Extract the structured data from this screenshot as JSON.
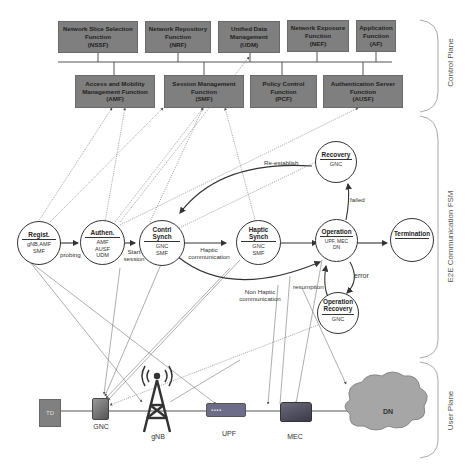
{
  "control_plane": {
    "label": "Control Plane",
    "top_functions": [
      {
        "name": "Network Slice Selection Function",
        "abbr": "(NSSF)"
      },
      {
        "name": "Network Repository Function",
        "abbr": "(NRF)"
      },
      {
        "name": "Unified Data Management",
        "abbr": "(UDM)"
      },
      {
        "name": "Network Exposure Function",
        "abbr": "(NEF)"
      },
      {
        "name": "Application Function",
        "abbr": "(AF)"
      }
    ],
    "bottom_functions": [
      {
        "name": "Access and Mobility Management Function",
        "abbr": "(AMF)"
      },
      {
        "name": "Session Management Function",
        "abbr": "(SMF)"
      },
      {
        "name": "Policy Control Function",
        "abbr": "(PCF)"
      },
      {
        "name": "Authentication Server Function",
        "abbr": "(AUSF)"
      }
    ]
  },
  "fsm": {
    "label": "E2E Communication FSM",
    "states": {
      "regist": {
        "title": "Regist.",
        "sub": "gNB,AMF SMF"
      },
      "authen": {
        "title": "Authen.",
        "sub": "AMF AUSF UDM"
      },
      "control_synch": {
        "title": "Contrl Synch",
        "sub": "GNC SMF"
      },
      "haptic_synch": {
        "title": "Haptic Synch",
        "sub": "GNC SMF"
      },
      "operation": {
        "title": "Operation",
        "sub": "UPF, MEC DN"
      },
      "termination": {
        "title": "Termination",
        "sub": ""
      },
      "recovery": {
        "title": "Recovery",
        "sub": "GNC"
      },
      "operation_recovery": {
        "title": "Operation Recovery",
        "sub": "GNC"
      }
    },
    "transitions": {
      "probing": "probing",
      "start_session": "Start session",
      "haptic_communication": "Haptic communication",
      "non_haptic_communication": "Non Haptic communication",
      "re_establish": "Re-establish",
      "failed": "failed",
      "error": "error",
      "resumption": "resumption"
    }
  },
  "user_plane": {
    "label": "User Plane",
    "devices": {
      "td": "TD",
      "gnc": "GNC",
      "gnb": "gNB",
      "upf": "UPF",
      "mec": "MEC",
      "dn": "DN"
    }
  },
  "colors": {
    "nf_box": "#7f7f7f",
    "line": "#555555",
    "cloud": "#a6a6a6"
  }
}
